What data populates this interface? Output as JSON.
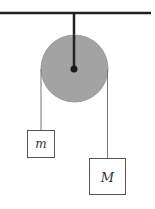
{
  "diagram": {
    "type": "atwood-machine",
    "colors": {
      "background": "#ffffff",
      "ceiling": "#222222",
      "rod": "#222222",
      "pulley_fill": "#a3a3a3",
      "pulley_stroke": "#8a8a8a",
      "axle": "#1a1a1a",
      "rope": "#777777",
      "block_stroke": "#555555"
    },
    "blocks": [
      {
        "id": "small",
        "label": "m"
      },
      {
        "id": "large",
        "label": "M"
      }
    ]
  }
}
